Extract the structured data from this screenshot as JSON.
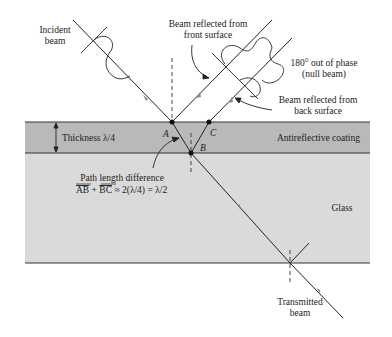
{
  "labels": {
    "incident_beam_line1": "Incident",
    "incident_beam_line2": "beam",
    "front_reflect_line1": "Beam reflected from",
    "front_reflect_line2": "front surface",
    "phase_line1": "180° out of phase",
    "phase_line2": "(null beam)",
    "back_reflect_line1": "Beam reflected from",
    "back_reflect_line2": "back surface",
    "thickness": "Thickness λ/4",
    "coating": "Antireflective coating",
    "point_a": "A",
    "point_b": "B",
    "point_c": "C",
    "path_diff_line1": "Path length difference",
    "path_diff_ab": "AB",
    "path_diff_plus": " + ",
    "path_diff_bc": "BC",
    "path_diff_rest": " ≈ 2(λ/4) = λ/2",
    "glass": "Glass",
    "transmitted_line1": "Transmitted",
    "transmitted_line2": "beam"
  },
  "colors": {
    "coating_fill": "#b9b9b9",
    "glass_fill": "#dadada",
    "line": "#222222",
    "background": "#ffffff"
  }
}
